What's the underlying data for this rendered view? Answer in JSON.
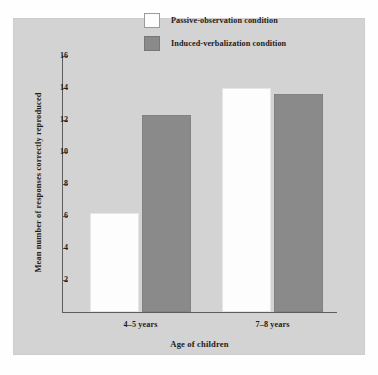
{
  "chart_data": {
    "type": "bar",
    "title": "",
    "xlabel": "Age of children",
    "ylabel": "Mean number of responses correctly reproduced",
    "categories": [
      "4–5 years",
      "7–8 years"
    ],
    "series": [
      {
        "name": "Passive-observation condition",
        "values": [
          6.2,
          14.0
        ],
        "color": "#fdfdfd"
      },
      {
        "name": "Induced-verbalization condition",
        "values": [
          12.3,
          13.6
        ],
        "color": "#8a8a8a"
      }
    ],
    "ylim": [
      0,
      16
    ],
    "yticks": [
      2,
      4,
      6,
      8,
      10,
      12,
      14,
      16
    ],
    "ytick_labels": [
      "2",
      "4",
      "6",
      "8",
      "10",
      "12",
      "14",
      "16"
    ],
    "grid": false,
    "legend_position": "top-center",
    "background_color": "#d3d3d3",
    "axis_color": "#5d5d5d"
  },
  "legend": {
    "entries": [
      {
        "label": "Passive-observation condition",
        "swatch": "white-swatch"
      },
      {
        "label": "Induced-verbalization condition",
        "swatch": "gray-swatch"
      }
    ]
  }
}
